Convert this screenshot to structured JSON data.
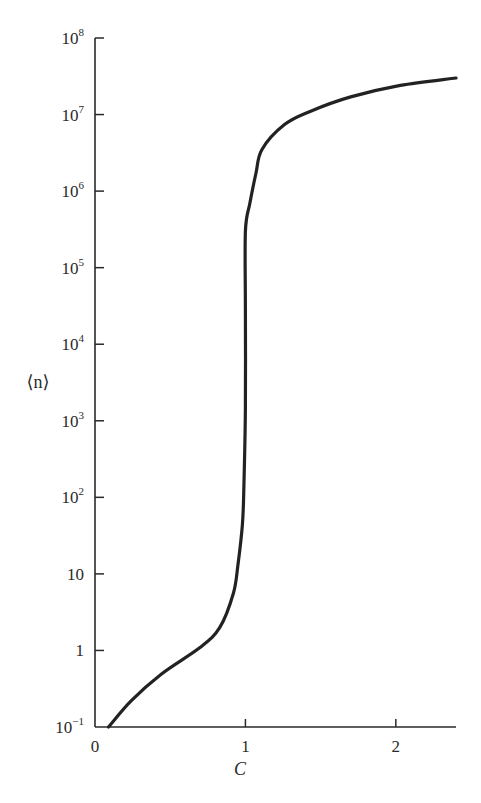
{
  "chart_data": {
    "type": "line",
    "title": "",
    "xlabel": "C",
    "ylabel": "⟨n⟩",
    "yscale": "log",
    "xlim": [
      0,
      2.4
    ],
    "ylim": [
      0.1,
      100000000
    ],
    "grid": false,
    "legend": null,
    "x_ticks": [
      {
        "value": 0,
        "label": "0"
      },
      {
        "value": 1,
        "label": "1"
      },
      {
        "value": 2,
        "label": "2"
      }
    ],
    "y_ticks": [
      {
        "value": 0.1,
        "base": "10",
        "exp": "−1"
      },
      {
        "value": 1,
        "base": "1",
        "exp": ""
      },
      {
        "value": 10,
        "base": "10",
        "exp": ""
      },
      {
        "value": 100,
        "base": "10",
        "exp": "2"
      },
      {
        "value": 1000,
        "base": "10",
        "exp": "3"
      },
      {
        "value": 10000,
        "base": "10",
        "exp": "4"
      },
      {
        "value": 100000,
        "base": "10",
        "exp": "5"
      },
      {
        "value": 1000000,
        "base": "10",
        "exp": "6"
      },
      {
        "value": 10000000,
        "base": "10",
        "exp": "7"
      },
      {
        "value": 100000000,
        "base": "10",
        "exp": "8"
      }
    ],
    "series": [
      {
        "name": "⟨n⟩ vs C",
        "color": "#222222",
        "x": [
          0.09,
          0.24,
          0.44,
          0.7,
          0.83,
          0.92,
          0.95,
          0.98,
          0.99,
          1.0,
          1.0,
          1.0,
          1.03,
          1.07,
          1.11,
          1.26,
          1.43,
          1.7,
          2.03,
          2.4
        ],
        "y": [
          0.1,
          0.22,
          0.49,
          1.1,
          2.0,
          5.6,
          13,
          44,
          140,
          1500,
          28000,
          300000,
          700000,
          1700000,
          3500000,
          7400000,
          11000000,
          17000000,
          24000000,
          30000000
        ]
      }
    ]
  }
}
